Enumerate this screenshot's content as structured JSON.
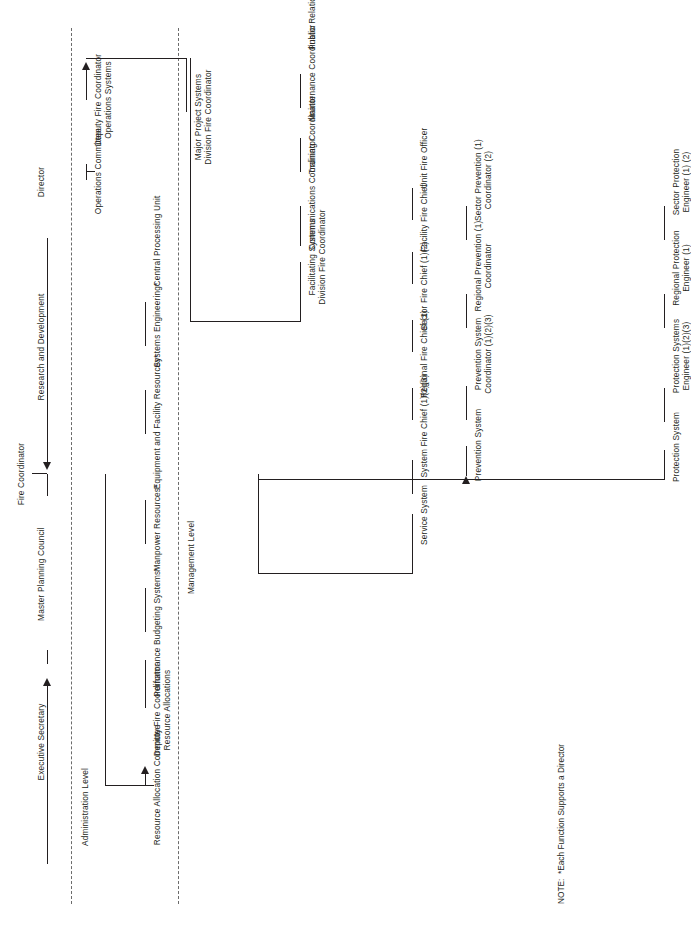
{
  "diagram": {
    "type": "organization-chart",
    "note": "NOTE:  *Each Function Supports a Director",
    "top": {
      "fire_coordinator": "Fire Coordinator",
      "executive_secretary": "Executive Secretary",
      "master_planning_council": "Master Planning Council",
      "research_and_development": "Research and Development",
      "director": "Director"
    },
    "bands": {
      "administration": "Administration Level",
      "management": "Management Level"
    },
    "administration": {
      "committee": "Resource Allocation Committee",
      "deputy": "Deputy Fire Coordinator\nResource Allocations",
      "units": [
        "Performance Budgeting Systems*",
        "Manpower Resources*",
        "Equipment and Facility Resources*",
        "Systems Engineering*",
        "Central Processing Unit"
      ]
    },
    "operations": {
      "committee": "Operations Committee",
      "deputy": "Deputy Fire Coordinator\nOperations Systems"
    },
    "major_project": {
      "head": "Major Project Systems\nDivision Fire Coordinator"
    },
    "facilitating": {
      "head": "Facilitating Systems\nDivision Fire Coordinator",
      "units": [
        "Communications Coordinator",
        "Training Coordinator",
        "Maintenance Coordinator",
        "Public Relations Coordinator"
      ]
    },
    "service_system": {
      "head": "Service System",
      "units": [
        "System Fire Chief (1)(2)(3)",
        "Regional Fire Chief (1)",
        "Sector Fire Chief (1)(2)",
        "Facility Fire Chief",
        "Unit Fire Officer"
      ]
    },
    "prevention_system": {
      "head": "Prevention System",
      "units": [
        "Prevention System\nCoordinator (1)(2)(3)",
        "Regional Prevention (1)\nCoordinator",
        "Sector Prevention (1)\nCoordinator (2)"
      ]
    },
    "protection_system": {
      "head": "Protection System",
      "units": [
        "Protection Systems\nEngineer (1)(2)(3)",
        "Regional Protection\nEngineer (1)",
        "Sector Protection\nEngineer (1) (2)"
      ]
    }
  }
}
